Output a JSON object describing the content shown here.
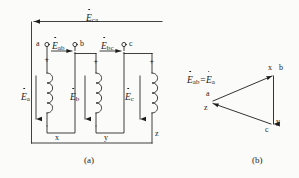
{
  "figure": {
    "ink_color": "#1d1d1d",
    "background_color": "#fbfbfa",
    "captions": [
      {
        "key": "a",
        "text": "(a)"
      },
      {
        "key": "b",
        "text": "(b)"
      }
    ]
  },
  "circuit": {
    "caption": "(a)",
    "top_terminals": [
      {
        "name": "a",
        "label": "a"
      },
      {
        "name": "b",
        "label": "b"
      },
      {
        "name": "c",
        "label": "c"
      }
    ],
    "bottom_terminals": [
      {
        "name": "x",
        "label": "x"
      },
      {
        "name": "y",
        "label": "y"
      },
      {
        "name": "z",
        "label": "z"
      }
    ],
    "polarity_marks": [
      {
        "name": "phase-a",
        "symbol": "+"
      },
      {
        "name": "phase-b",
        "symbol": "+"
      },
      {
        "name": "phase-c",
        "symbol": "+"
      }
    ],
    "coils": [
      {
        "name": "coil-a",
        "emf_symbol": "E",
        "emf_subscript": "a",
        "arrow_direction": "down"
      },
      {
        "name": "coil-b",
        "emf_symbol": "E",
        "emf_subscript": "b",
        "arrow_direction": "down"
      },
      {
        "name": "coil-c",
        "emf_symbol": "E",
        "emf_subscript": "c",
        "arrow_direction": "down"
      }
    ],
    "line_voltages": [
      {
        "name": "E-ab",
        "symbol": "E",
        "subscript": "ab",
        "arrow_direction": "right"
      },
      {
        "name": "E-bc",
        "symbol": "E",
        "subscript": "bc",
        "arrow_direction": "right"
      },
      {
        "name": "E-ca",
        "symbol": "E",
        "subscript": "ca",
        "arrow_direction": "left"
      }
    ]
  },
  "phasor": {
    "caption": "(b)",
    "equation": {
      "symbol_left": "E",
      "sub_left": "ab",
      "equals": "=",
      "symbol_right": "E",
      "sub_right": "a"
    },
    "vertices": [
      {
        "name": "vertex-top",
        "labels": [
          "x",
          "b"
        ]
      },
      {
        "name": "vertex-left",
        "labels": [
          "a",
          "z"
        ]
      },
      {
        "name": "vertex-bottom",
        "labels": [
          "c",
          "y"
        ]
      }
    ],
    "vertex_labels": {
      "top_x": "x",
      "top_b": "b",
      "left_a": "a",
      "left_z": "z",
      "bottom_c": "c",
      "bottom_y": "y"
    }
  }
}
